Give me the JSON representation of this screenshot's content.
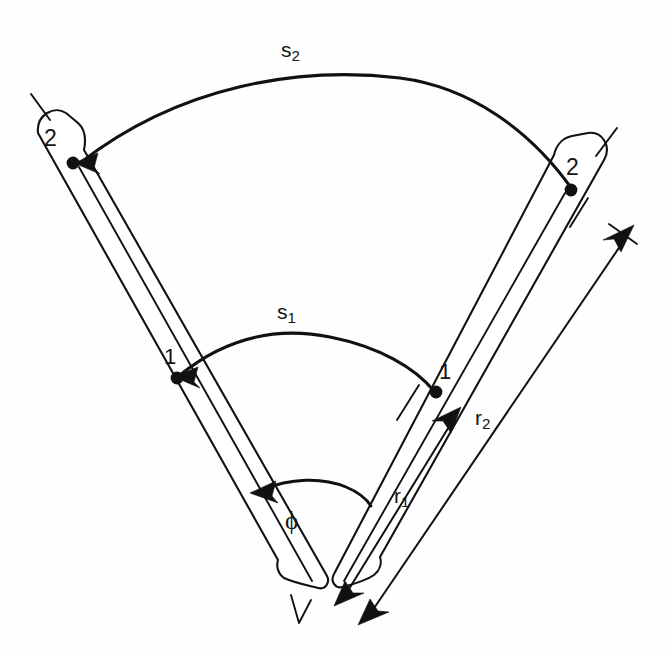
{
  "figure": {
    "type": "geometry-diagram",
    "background_color": "#fefefe",
    "ink_color": "#111111",
    "width": 672,
    "height": 651
  },
  "labels": {
    "arc_outer": "s",
    "arc_outer_sub": "2",
    "arc_inner": "s",
    "arc_inner_sub": "1",
    "radius_inner": "r",
    "radius_inner_sub": "1",
    "radius_outer": "r",
    "radius_outer_sub": "2",
    "angle": "ϕ",
    "mark_two_left": "2",
    "mark_two_right": "2",
    "mark_one_left": "1",
    "mark_one_right": "1"
  },
  "geometry": {
    "vertex": {
      "x": 318,
      "y": 588
    },
    "angle_degrees": 78,
    "inner_radius_px": 222,
    "outer_radius_px": 443,
    "left_arm_angle_deg": 219,
    "right_arm_angle_deg": 309
  },
  "annotations": [
    {
      "name": "outer-arc",
      "label": "s2",
      "role": "arc-length-outer",
      "endpoint_left": "2",
      "endpoint_right": "2"
    },
    {
      "name": "inner-arc",
      "label": "s1",
      "role": "arc-length-inner",
      "endpoint_left": "1",
      "endpoint_right": "1"
    },
    {
      "name": "angle-arc",
      "label": "phi",
      "role": "subtended-angle"
    },
    {
      "name": "inner-radius-dimension",
      "label": "r1",
      "role": "dimension-line"
    },
    {
      "name": "outer-radius-dimension",
      "label": "r2",
      "role": "dimension-line"
    }
  ]
}
